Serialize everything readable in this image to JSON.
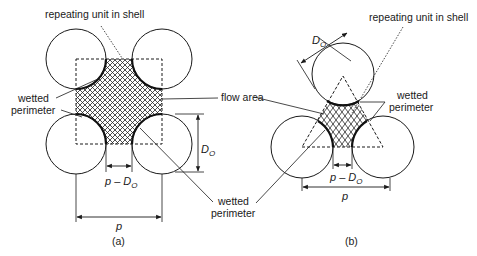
{
  "figure": {
    "panel_a": {
      "caption": "(a)",
      "arrangement": "square pitch",
      "labels": {
        "repeating_unit": "repeating unit in shell",
        "wetted_perimeter_left_1": "wetted",
        "wetted_perimeter_left_2": "perimeter",
        "flow_area": "flow area",
        "wetted_perimeter_right_1": "wetted",
        "wetted_perimeter_right_2": "perimeter",
        "pitch": "p",
        "gap": "p – D",
        "gap_sub": "O",
        "diameter": "D",
        "diameter_sub": "O"
      }
    },
    "panel_b": {
      "caption": "(b)",
      "arrangement": "triangular pitch",
      "labels": {
        "repeating_unit": "repeating unit in shell",
        "wetted_perimeter_1": "wetted",
        "wetted_perimeter_2": "perimeter",
        "pitch": "p",
        "gap": "p – D",
        "gap_sub": "O",
        "diameter": "D",
        "diameter_sub": "O"
      }
    },
    "colors": {
      "line": "#1a1a1a",
      "background": "#ffffff"
    }
  }
}
